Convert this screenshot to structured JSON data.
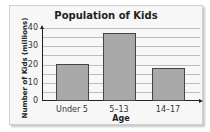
{
  "chart_data": {
    "type": "bar",
    "title": "Population of Kids",
    "xlabel": "Age",
    "ylabel": "Number of Kids (millions)",
    "categories": [
      "Under 5",
      "5–13",
      "14–17"
    ],
    "values": [
      20,
      37,
      18
    ],
    "ylim": [
      0,
      40
    ],
    "yticks": [
      0,
      10,
      20,
      30,
      40
    ],
    "grid": true,
    "grid_step": 5,
    "bar_color": "#a9a9a9"
  }
}
